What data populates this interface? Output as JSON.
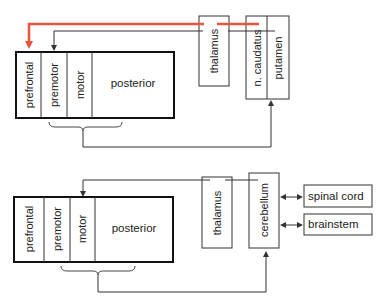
{
  "top_diagram": {
    "cortex": {
      "regions": [
        "prefrontal",
        "premotor",
        "motor",
        "posterior"
      ]
    },
    "thalamus": "thalamus",
    "basal_ganglia": [
      "n. caudatus",
      "putamen"
    ],
    "colors": {
      "highlight_pathway": "#e8553f",
      "lines": "#333333"
    }
  },
  "bottom_diagram": {
    "cortex": {
      "regions": [
        "prefrontal",
        "premotor",
        "motor",
        "posterior"
      ]
    },
    "thalamus": "thalamus",
    "cerebellum": "cerebellum",
    "outputs": [
      "spinal cord",
      "brainstem"
    ]
  }
}
